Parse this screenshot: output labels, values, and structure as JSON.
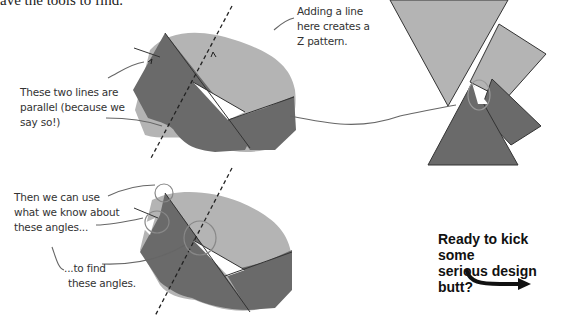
{
  "page": {
    "top_text": "ave the tools to find."
  },
  "annotations": {
    "z_pattern": "Adding a line here creates a Z pattern.",
    "z_pattern_lines": [
      "Adding a line",
      "here creates a",
      "Z pattern."
    ],
    "parallel_lines": [
      "These two lines are",
      "parallel (because we",
      "say so!)"
    ],
    "use_angles": [
      "Then we can use",
      "what we know about",
      "these angles..."
    ],
    "find_angles": [
      "...to find",
      "these angles."
    ]
  },
  "cta": {
    "lines": [
      "Ready to kick some",
      "serious design butt?"
    ]
  },
  "colors": {
    "light_gray": "#b4b4b4",
    "dark_gray": "#6a6a6a",
    "outline": "#333333",
    "annotation": "#666666"
  }
}
